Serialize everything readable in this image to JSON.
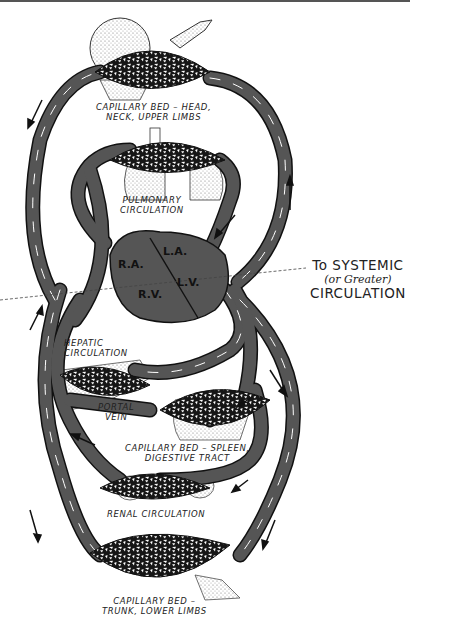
{
  "diagram": {
    "type": "circulatory-system-schematic",
    "colors": {
      "vessel": "#555555",
      "vessel_outline": "#111111",
      "highlight": "#ffffff",
      "heart": "#555555",
      "capillary_bed": "#1a1a1a",
      "organ_stipple": "#d9d9d9"
    },
    "labels": {
      "capillary_head_1": "CAPILLARY BED – HEAD,",
      "capillary_head_2": "NECK, UPPER LIMBS",
      "pulmonary_1": "PULMONARY",
      "pulmonary_2": "CIRCULATION",
      "hepatic_1": "HEPATIC",
      "hepatic_2": "CIRCULATION",
      "portal_1": "PORTAL",
      "portal_2": "VEIN",
      "spleen_1": "CAPILLARY BED – SPLEEN,",
      "spleen_2": "DIGESTIVE TRACT",
      "renal": "RENAL CIRCULATION",
      "trunk_1": "CAPILLARY BED –",
      "trunk_2": "TRUNK, LOWER LIMBS"
    },
    "heart": {
      "ra": "R.A.",
      "la": "L.A.",
      "rv": "R.V.",
      "lv": "L.V."
    },
    "callout": {
      "line1": "To SYSTEMIC",
      "line2": "(or Greater)",
      "line3": "CIRCULATION"
    }
  }
}
